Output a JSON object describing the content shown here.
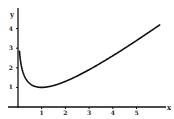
{
  "chart_data": {
    "type": "line",
    "title": "",
    "xlabel": "x",
    "ylabel": "y",
    "xlim": [
      -0.4,
      6.3
    ],
    "ylim": [
      0,
      4.6
    ],
    "x_ticks": [
      "1",
      "2",
      "3",
      "4",
      "5"
    ],
    "y_ticks": [
      "1",
      "2",
      "3",
      "4"
    ],
    "grid": false,
    "legend": null,
    "series": [
      {
        "name": "y = x - ln x",
        "x": [
          0.06,
          0.1,
          0.15,
          0.2,
          0.3,
          0.4,
          0.5,
          0.6,
          0.8,
          1.0,
          1.25,
          1.5,
          2.0,
          2.5,
          3.0,
          3.5,
          4.0,
          4.5,
          5.0,
          5.5,
          6.0
        ],
        "y": [
          2.87,
          2.4,
          2.05,
          1.81,
          1.5,
          1.32,
          1.19,
          1.11,
          1.02,
          1.0,
          1.03,
          1.09,
          1.31,
          1.58,
          1.9,
          2.25,
          2.61,
          2.99,
          3.39,
          3.8,
          4.21
        ]
      }
    ]
  }
}
